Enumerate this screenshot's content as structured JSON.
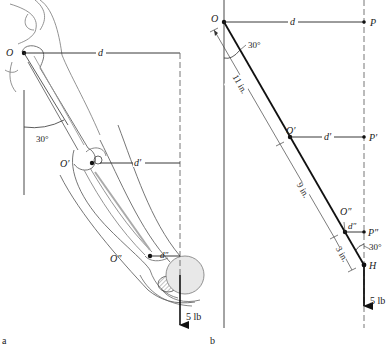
{
  "panel_a": {
    "label": "a",
    "points": {
      "O": "O",
      "O_prime": "O′",
      "O_dprime": "O″"
    },
    "distances": {
      "d": "d",
      "d_prime": "d′",
      "d_dprime": "d″"
    },
    "angle": "30°",
    "force": "5 lb"
  },
  "panel_b": {
    "label": "b",
    "points": {
      "O": "O",
      "O_prime": "O′",
      "O_dprime": "O″",
      "P": "P",
      "P_prime": "P′",
      "P_dprime": "P″",
      "H": "H"
    },
    "distances": {
      "d": "d",
      "d_prime": "d′",
      "d_dprime": "d″"
    },
    "segments": {
      "upper_arm": "11 in.",
      "forearm": "9 in.",
      "hand": "3 in."
    },
    "angle_top": "30°",
    "angle_bottom": "30°",
    "force": "5 lb"
  },
  "colors": {
    "line": "#1a1a1a",
    "sketch": "#555555",
    "dashed": "#666666",
    "background": "#ffffff"
  }
}
